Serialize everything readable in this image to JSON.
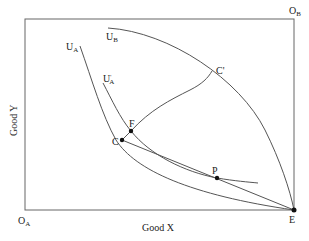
{
  "diagram": {
    "type": "edgeworth-box",
    "origins": {
      "a": {
        "main": "O",
        "sub": "A"
      },
      "b": {
        "main": "O",
        "sub": "B"
      }
    },
    "axes": {
      "x_label": "Good X",
      "y_label": "Good Y"
    },
    "curves": {
      "ua": {
        "main": "U",
        "sub": "A"
      },
      "ua_prime": {
        "main": "U",
        "sub": "A",
        "prime": "'"
      },
      "ub": {
        "main": "U",
        "sub": "B"
      }
    },
    "points": {
      "c": "C",
      "c_prime": "C'",
      "f": "F",
      "p": "P",
      "e": "E"
    },
    "colors": {
      "line": "#555555",
      "point": "#111111",
      "text": "#222222"
    }
  }
}
